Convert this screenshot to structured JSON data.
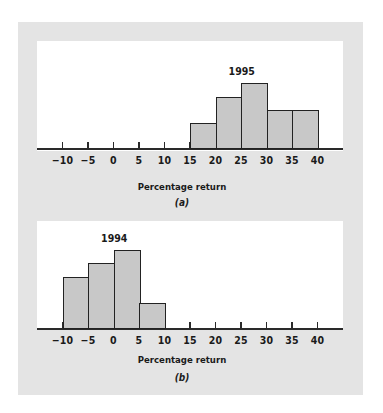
{
  "chart_data": [
    {
      "type": "bar",
      "title": "1995",
      "sublabel": "(a)",
      "xlabel": "Percentage return",
      "ylabel": "",
      "x_ticks": [
        "−10",
        "−5",
        "0",
        "5",
        "10",
        "15",
        "20",
        "25",
        "30",
        "35",
        "40"
      ],
      "bins": [
        [
          15,
          20
        ],
        [
          20,
          25
        ],
        [
          25,
          30
        ],
        [
          30,
          35
        ],
        [
          35,
          40
        ]
      ],
      "categories": [
        "15–20",
        "20–25",
        "25–30",
        "30–35",
        "35–40"
      ],
      "values": [
        2,
        4,
        5,
        3,
        3
      ],
      "xlim": [
        -15,
        45
      ],
      "grid": false
    },
    {
      "type": "bar",
      "title": "1994",
      "sublabel": "(b)",
      "xlabel": "Percentage return",
      "ylabel": "",
      "x_ticks": [
        "−10",
        "−5",
        "0",
        "5",
        "10",
        "15",
        "20",
        "25",
        "30",
        "35",
        "40"
      ],
      "bins": [
        [
          -10,
          -5
        ],
        [
          -5,
          0
        ],
        [
          0,
          5
        ],
        [
          5,
          10
        ]
      ],
      "categories": [
        "−10–−5",
        "−5–0",
        "0–5",
        "5–10"
      ],
      "values": [
        4,
        5,
        6,
        2
      ],
      "xlim": [
        -15,
        45
      ],
      "grid": false
    }
  ],
  "panels": {
    "a": {
      "year": "1995",
      "xlabel": "Percentage return",
      "sublabel": "(a)"
    },
    "b": {
      "year": "1994",
      "xlabel": "Percentage return",
      "sublabel": "(b)"
    }
  },
  "colors": {
    "panel_bg": "#e4e4e4",
    "plot_bg": "#ffffff",
    "bar_fill": "#c8c8c8",
    "bar_edge": "#222222"
  }
}
